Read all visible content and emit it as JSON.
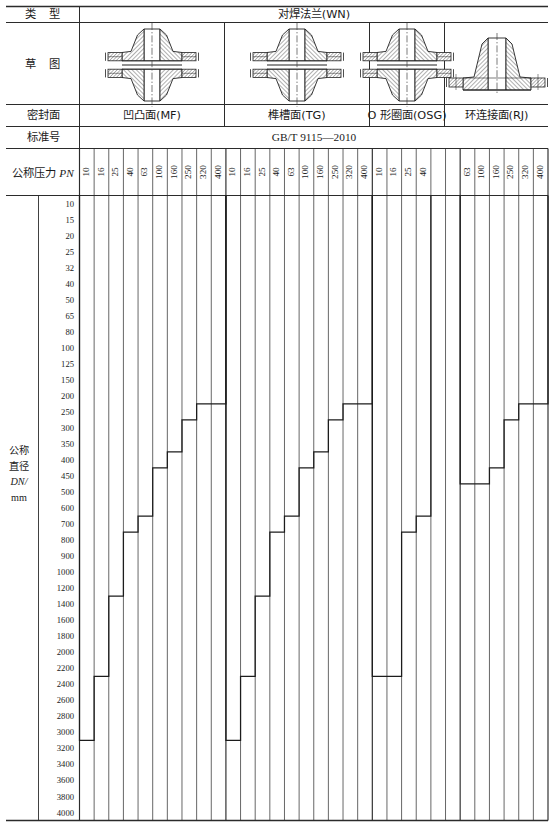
{
  "document": {
    "standard_no": "GB/T 9115—2010",
    "row_labels": {
      "type": "类　型",
      "sketch": "草　图",
      "sealing_face": "密封面",
      "standard_no": "标准号",
      "nominal_pressure": "公称压力",
      "nominal_pressure_sym": "PN",
      "nominal_diameter_lines": [
        "公称",
        "直径",
        "DN/",
        "mm"
      ]
    },
    "type_value": "对焊法兰(WN)",
    "groups": [
      {
        "key": "MF",
        "sealing_face": "凹凸面(MF)",
        "sketch": "two-flange-pair-mf",
        "pn": [
          "10",
          "16",
          "25",
          "40",
          "63",
          "100",
          "160",
          "250",
          "320",
          "400"
        ],
        "max_dn": [
          3000,
          2200,
          1200,
          700,
          600,
          400,
          350,
          250,
          200,
          200
        ]
      },
      {
        "key": "TG",
        "sealing_face": "榫槽面(TG)",
        "sketch": "two-flange-pair-tg",
        "pn": [
          "10",
          "16",
          "25",
          "40",
          "63",
          "100",
          "160",
          "250",
          "320",
          "400"
        ],
        "max_dn": [
          3000,
          2200,
          1200,
          700,
          600,
          400,
          350,
          250,
          200,
          200
        ]
      },
      {
        "key": "OSG",
        "sealing_face": "O 形圈面(OSG)",
        "sketch": "two-flange-pair-osg",
        "pn": [
          "10",
          "16",
          "25",
          "40"
        ],
        "max_dn": [
          2200,
          2200,
          700,
          600
        ],
        "blank_columns": 2
      },
      {
        "key": "RJ",
        "sealing_face": "环连接面(RJ)",
        "sketch": "single-flange-rj",
        "pn": [
          "63",
          "100",
          "160",
          "250",
          "320",
          "400"
        ],
        "max_dn": [
          450,
          450,
          400,
          250,
          200,
          200
        ]
      }
    ],
    "dn_values": [
      10,
      15,
      20,
      25,
      32,
      40,
      50,
      65,
      80,
      100,
      125,
      150,
      200,
      250,
      300,
      350,
      400,
      450,
      500,
      600,
      700,
      800,
      900,
      1000,
      1200,
      1400,
      1600,
      1800,
      2000,
      2200,
      2400,
      2600,
      2800,
      3000,
      3200,
      3400,
      3600,
      3800,
      4000
    ]
  },
  "chart_data": {
    "type": "table",
    "xlabel": "公称压力 PN",
    "ylabel": "公称直径 DN/mm",
    "categories": [
      "MF-10",
      "MF-16",
      "MF-25",
      "MF-40",
      "MF-63",
      "MF-100",
      "MF-160",
      "MF-250",
      "MF-320",
      "MF-400",
      "TG-10",
      "TG-16",
      "TG-25",
      "TG-40",
      "TG-63",
      "TG-100",
      "TG-160",
      "TG-250",
      "TG-320",
      "TG-400",
      "OSG-10",
      "OSG-16",
      "OSG-25",
      "OSG-40",
      "RJ-63",
      "RJ-100",
      "RJ-160",
      "RJ-250",
      "RJ-320",
      "RJ-400"
    ],
    "values": [
      3000,
      2200,
      1200,
      700,
      600,
      400,
      350,
      250,
      200,
      200,
      3000,
      2200,
      1200,
      700,
      600,
      400,
      350,
      250,
      200,
      200,
      2200,
      2200,
      700,
      600,
      450,
      450,
      400,
      250,
      200,
      200
    ],
    "grid": true,
    "legend": "none"
  }
}
